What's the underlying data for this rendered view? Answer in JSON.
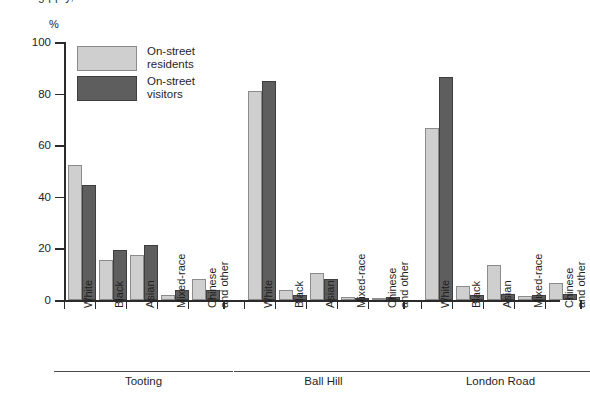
{
  "page": {
    "unit_label": "%",
    "title_clipped": "g                       pp                                         y,"
  },
  "legend": {
    "position": "top-left-inside",
    "items": [
      {
        "name": "residents",
        "line1": "On-street",
        "line2": "residents",
        "color": "#cfcfcf"
      },
      {
        "name": "visitors",
        "line1": "On-street",
        "line2": "visitors",
        "color": "#5e5e5e"
      }
    ]
  },
  "axis": {
    "y_ticks": [
      "0",
      "20",
      "40",
      "60",
      "80",
      "100"
    ],
    "y_values": [
      0,
      20,
      40,
      60,
      80,
      100
    ]
  },
  "groups": [
    {
      "label": "Tooting"
    },
    {
      "label": "Ball Hill"
    },
    {
      "label": "London Road"
    }
  ],
  "categories": [
    {
      "line1": "White",
      "line2": ""
    },
    {
      "line1": "Black",
      "line2": ""
    },
    {
      "line1": "Asian",
      "line2": ""
    },
    {
      "line1": "Mixed-race",
      "line2": ""
    },
    {
      "line1": "Chinese",
      "line2": "and other"
    }
  ],
  "chart_data": {
    "type": "bar",
    "title": "",
    "xlabel": "",
    "ylabel": "%",
    "ylim": [
      0,
      100
    ],
    "yticks": [
      0,
      20,
      40,
      60,
      80,
      100
    ],
    "grid": false,
    "legend_position": "top-left",
    "categories": [
      "White",
      "Black",
      "Asian",
      "Mixed-race",
      "Chinese and other"
    ],
    "groups": [
      "Tooting",
      "Ball Hill",
      "London Road"
    ],
    "series": [
      {
        "name": "On-street residents",
        "color": "#cfcfcf",
        "values_by_group": {
          "Tooting": [
            52.5,
            15.5,
            17.5,
            2.0,
            8.0
          ],
          "Ball Hill": [
            81.0,
            4.0,
            10.5,
            1.0,
            0.5
          ],
          "London Road": [
            66.5,
            5.5,
            13.5,
            1.5,
            6.5
          ]
        }
      },
      {
        "name": "On-street visitors",
        "color": "#5e5e5e",
        "values_by_group": {
          "Tooting": [
            44.5,
            19.5,
            21.5,
            4.0,
            4.0
          ],
          "Ball Hill": [
            85.0,
            2.0,
            8.0,
            0.8,
            1.0
          ],
          "London Road": [
            86.5,
            2.0,
            2.5,
            2.0,
            2.5
          ]
        }
      }
    ]
  }
}
